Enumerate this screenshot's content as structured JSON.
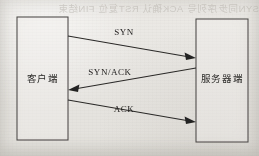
{
  "page": {
    "background_color": "#e9e7e3",
    "ink_color": "#2a2927",
    "bleed_through_text": "SYN同步序列号  ACK确认  RST复位  FIN结束"
  },
  "diagram": {
    "type": "sequence-diagram",
    "nodes": [
      {
        "id": "client",
        "label": "客户端",
        "x": 17,
        "y": 17,
        "width": 51,
        "height": 123
      },
      {
        "id": "server",
        "label": "服务器端",
        "x": 196,
        "y": 19,
        "width": 52,
        "height": 123
      }
    ],
    "messages": [
      {
        "label": "SYN",
        "from": "client",
        "to": "server",
        "direction": "left-to-right",
        "x1": 68,
        "y1": 36,
        "x2": 196,
        "y2": 58,
        "label_x": 124,
        "label_y": 35
      },
      {
        "label": "SYN/ACK",
        "from": "server",
        "to": "client",
        "direction": "right-to-left",
        "x1": 196,
        "y1": 68,
        "x2": 68,
        "y2": 90,
        "label_x": 110,
        "label_y": 75
      },
      {
        "label": "ACK",
        "from": "client",
        "to": "server",
        "direction": "left-to-right",
        "x1": 68,
        "y1": 100,
        "x2": 196,
        "y2": 122,
        "label_x": 124,
        "label_y": 112
      }
    ]
  }
}
